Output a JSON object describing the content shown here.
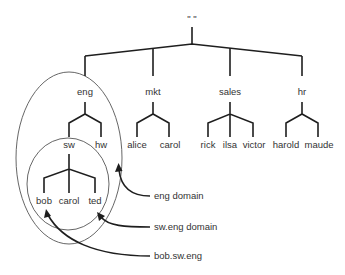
{
  "diagram": {
    "type": "hierarchical-namespace-tree",
    "root": {
      "label": "\" \""
    },
    "domains": [
      {
        "label": "eng",
        "children": [
          {
            "label": "sw",
            "children": [
              {
                "label": "bob"
              },
              {
                "label": "carol"
              },
              {
                "label": "ted"
              }
            ]
          },
          {
            "label": "hw"
          }
        ]
      },
      {
        "label": "mkt",
        "children": [
          {
            "label": "alice"
          },
          {
            "label": "carol"
          }
        ]
      },
      {
        "label": "sales",
        "children": [
          {
            "label": "rick"
          },
          {
            "label": "ilsa"
          },
          {
            "label": "victor"
          }
        ]
      },
      {
        "label": "hr",
        "children": [
          {
            "label": "harold"
          },
          {
            "label": "maude"
          }
        ]
      }
    ],
    "annotations": [
      {
        "label": "eng domain",
        "target": "outer ellipse around eng subtree"
      },
      {
        "label": "sw.eng domain",
        "target": "inner ellipse around sw subtree"
      },
      {
        "label": "bob.sw.eng",
        "target": "bob leaf node"
      }
    ]
  },
  "labels": {
    "root": "\" \"",
    "eng": "eng",
    "mkt": "mkt",
    "sales": "sales",
    "hr": "hr",
    "sw": "sw",
    "hw": "hw",
    "alice": "alice",
    "mkt_carol": "carol",
    "rick": "rick",
    "ilsa": "ilsa",
    "victor": "victor",
    "harold": "harold",
    "maude": "maude",
    "bob": "bob",
    "sw_carol": "carol",
    "ted": "ted",
    "ann_eng": "eng domain",
    "ann_sw": "sw.eng domain",
    "ann_bob": "bob.sw.eng"
  },
  "colors": {
    "line": "#1e1e1e",
    "text": "#333333",
    "ellipse": "#555555",
    "background": "#ffffff"
  }
}
